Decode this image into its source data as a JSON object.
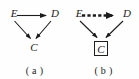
{
  "figure": {
    "background_color": "#fefefe",
    "ink_color": "#1c1c1c",
    "width": 139,
    "height": 79
  },
  "panels": [
    {
      "id": "a",
      "caption": "( a )",
      "nodes": [
        {
          "id": "E",
          "label": "E",
          "boxed": false
        },
        {
          "id": "D",
          "label": "D",
          "boxed": false
        },
        {
          "id": "C",
          "label": "C",
          "boxed": false
        }
      ],
      "edges": [
        {
          "from": "E",
          "to": "D",
          "style": "solid",
          "arrow": "single"
        },
        {
          "from": "E",
          "to": "C",
          "style": "solid",
          "arrow": "single"
        },
        {
          "from": "D",
          "to": "C",
          "style": "solid",
          "arrow": "single"
        }
      ]
    },
    {
      "id": "b",
      "caption": "( b )",
      "nodes": [
        {
          "id": "E",
          "label": "E",
          "boxed": false
        },
        {
          "id": "D",
          "label": "D",
          "boxed": false
        },
        {
          "id": "C",
          "label": "C",
          "boxed": true
        }
      ],
      "edges": [
        {
          "from": "E",
          "to": "D",
          "style": "dashed",
          "arrow": "single"
        },
        {
          "from": "E",
          "to": "C",
          "style": "solid",
          "arrow": "single"
        },
        {
          "from": "D",
          "to": "C",
          "style": "solid",
          "arrow": "single"
        }
      ]
    }
  ],
  "labels": {
    "panel_a": {
      "node_E": "E",
      "node_D": "D",
      "node_C": "C",
      "caption": "( a )"
    },
    "panel_b": {
      "node_E": "E",
      "node_D": "D",
      "node_C": "C",
      "caption": "( b )"
    }
  }
}
